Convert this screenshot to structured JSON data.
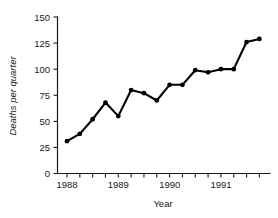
{
  "chart_data": {
    "type": "line",
    "title": "",
    "subtitle": "",
    "xlabel": "Year",
    "ylabel": "Deaths per quarter",
    "xlim": [
      1988.0,
      1991.75
    ],
    "ylim": [
      0,
      150
    ],
    "grid": false,
    "legend": null,
    "y_ticks": [
      0,
      25,
      50,
      75,
      100,
      125,
      150
    ],
    "y_tick_labels": [
      "0",
      "25",
      "50",
      "75",
      "100",
      "125",
      "150"
    ],
    "x_major_tick_labels": [
      "1988",
      "1989",
      "1990",
      "1991"
    ],
    "x_major_tick_values": [
      1988,
      1989,
      1990,
      1991
    ],
    "x_minor_tick_count": 16,
    "marker": "filled-circle",
    "line_color": "#000000",
    "marker_color": "#000000",
    "axis_color": "#1a1a1a",
    "background_color": "#ffffff",
    "x": [
      1988.0,
      1988.25,
      1988.5,
      1988.75,
      1989.0,
      1989.25,
      1989.5,
      1989.75,
      1990.0,
      1990.25,
      1990.5,
      1990.75,
      1991.0,
      1991.25,
      1991.5,
      1991.75
    ],
    "x_quarter_labels": [
      "1988 Q1",
      "1988 Q2",
      "1988 Q3",
      "1988 Q4",
      "1989 Q1",
      "1989 Q2",
      "1989 Q3",
      "1989 Q4",
      "1990 Q1",
      "1990 Q2",
      "1990 Q3",
      "1990 Q4",
      "1991 Q1",
      "1991 Q2",
      "1991 Q3",
      "1991 Q4"
    ],
    "values": [
      31,
      38,
      52,
      68,
      55,
      80,
      77,
      70,
      85,
      85,
      99,
      97,
      100,
      100,
      126,
      129
    ],
    "series": [
      {
        "name": "Deaths per quarter",
        "values": [
          31,
          38,
          52,
          68,
          55,
          80,
          77,
          70,
          85,
          85,
          99,
          97,
          100,
          100,
          126,
          129
        ]
      }
    ]
  }
}
